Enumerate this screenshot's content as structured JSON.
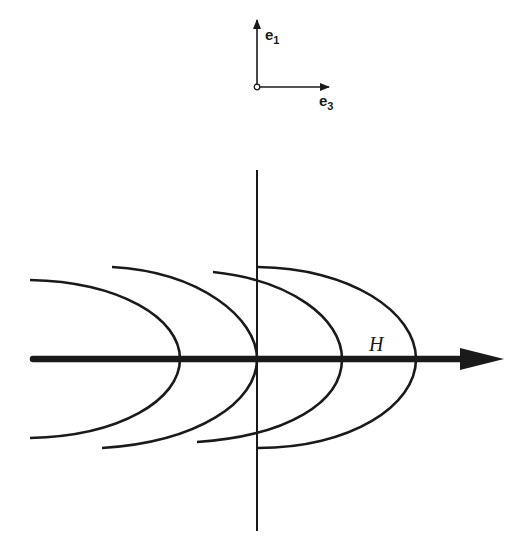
{
  "figure": {
    "axes_legend": {
      "vertical_label": "e",
      "vertical_subscript": "1",
      "horizontal_label": "e",
      "horizontal_subscript": "3"
    },
    "field_arrow_label": "H",
    "wavefronts": 4,
    "colors": {
      "ink": "#1a1a1a",
      "background": "#ffffff"
    }
  }
}
